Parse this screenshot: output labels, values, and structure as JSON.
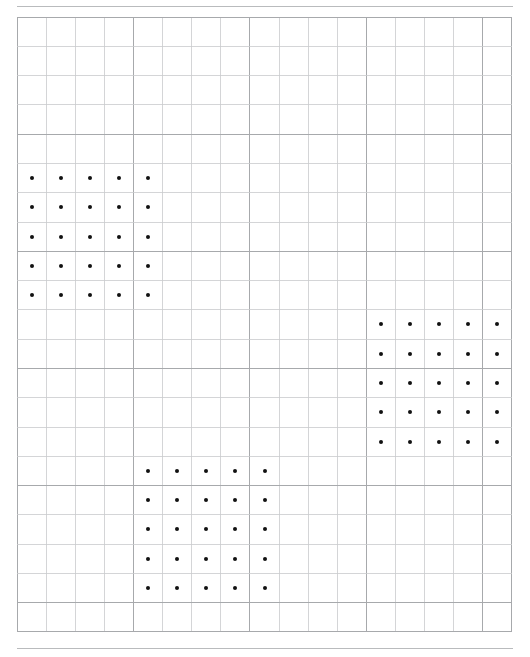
{
  "page": {
    "background_color": "#ffffff",
    "width": 530,
    "height": 657
  },
  "rules": {
    "color": "#b9bbbd",
    "top_y": 6,
    "bottom_y": 648,
    "left_x": 17,
    "width": 496
  },
  "grid": {
    "origin_x": 17,
    "origin_y": 17,
    "columns": 17,
    "rows": 21,
    "cell_width": 29.12,
    "cell_height": 29.28,
    "line_color": "#c9cbcd",
    "major_line_color": "#a7a9ac",
    "major_every": 4,
    "border_color": "#a7a9ac"
  },
  "dots": {
    "color": "#111111",
    "radius": 2,
    "blocks": [
      {
        "name": "top-left-block",
        "col_start": 0,
        "row_start": 5,
        "cols": 5,
        "rows": 5,
        "count": 25
      },
      {
        "name": "middle-right-block",
        "col_start": 12,
        "row_start": 10,
        "cols": 5,
        "rows": 5,
        "count": 25
      },
      {
        "name": "bottom-middle-block",
        "col_start": 4,
        "row_start": 15,
        "cols": 5,
        "rows": 5,
        "count": 25
      }
    ],
    "total_count": 75
  }
}
